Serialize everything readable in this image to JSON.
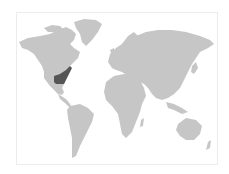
{
  "map": {
    "type": "world-range-map",
    "colors": {
      "background": "#ffffff",
      "land": "#c6c6c6",
      "highlight": "#555555",
      "frame_border": "#ececec"
    },
    "highlighted_regions": [
      {
        "name": "Southeastern United States",
        "continent": "North America"
      }
    ]
  }
}
